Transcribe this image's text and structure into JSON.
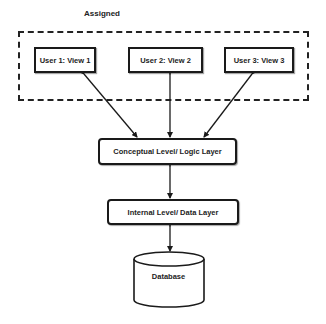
{
  "diagram": {
    "title": "Assigned",
    "group": {
      "label": "Assigned",
      "style": "dashed"
    },
    "user_views": [
      {
        "label": "User 1: View 1"
      },
      {
        "label": "User 2: View 2"
      },
      {
        "label": "User 3: View 3"
      }
    ],
    "conceptual_layer": {
      "label": "Conceptual Level/ Logic Layer"
    },
    "internal_layer": {
      "label": "Internal Level/ Data Layer"
    },
    "database": {
      "label": "Database",
      "shape": "cylinder"
    },
    "connections": [
      {
        "from": "User 1: View 1",
        "to": "Conceptual Level/ Logic Layer",
        "type": "bidirectional-arrow"
      },
      {
        "from": "User 2: View 2",
        "to": "Conceptual Level/ Logic Layer",
        "type": "bidirectional-arrow"
      },
      {
        "from": "User 3: View 3",
        "to": "Conceptual Level/ Logic Layer",
        "type": "bidirectional-arrow"
      },
      {
        "from": "Conceptual Level/ Logic Layer",
        "to": "Internal Level/ Data Layer",
        "type": "bidirectional-arrow"
      },
      {
        "from": "Internal Level/ Data Layer",
        "to": "Database",
        "type": "bidirectional-arrow"
      }
    ],
    "colors": {
      "stroke": "#1a1a1a",
      "background": "#ffffff",
      "text": "#222222"
    }
  }
}
